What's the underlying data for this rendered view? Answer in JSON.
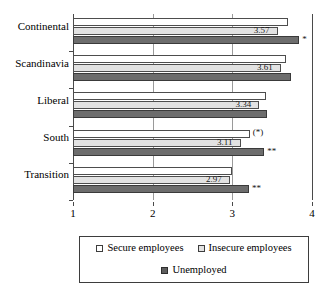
{
  "chart_data": {
    "type": "bar",
    "orientation": "horizontal",
    "title": "",
    "xlabel": "",
    "ylabel": "",
    "xlim": [
      1,
      4
    ],
    "xticks": [
      "1",
      "2",
      "3",
      "4"
    ],
    "grid": true,
    "legend_position": "bottom",
    "categories": [
      "Continental",
      "Scandinavia",
      "Liberal",
      "South",
      "Transition"
    ],
    "series": [
      {
        "name": "Secure employees",
        "color": "#ffffff",
        "values": [
          3.7,
          3.67,
          3.42,
          3.22,
          3.0
        ]
      },
      {
        "name": "Insecure employees",
        "color": "#e2e2e2",
        "values": [
          3.57,
          3.61,
          3.34,
          3.11,
          2.97
        ]
      },
      {
        "name": "Unemployed",
        "color": "#6d6d6d",
        "values": [
          3.84,
          3.74,
          3.43,
          3.4,
          3.21
        ]
      }
    ],
    "data_labels": {
      "Insecure employees": [
        "3.57",
        "3.61",
        "3.34",
        "3.11",
        "2.97"
      ]
    },
    "annotations": [
      {
        "category": "Continental",
        "series": "Unemployed",
        "text": "*"
      },
      {
        "category": "South",
        "series": "Secure employees",
        "text": "(*)"
      },
      {
        "category": "South",
        "series": "Unemployed",
        "text": "**"
      },
      {
        "category": "Transition",
        "series": "Unemployed",
        "text": "**"
      }
    ]
  },
  "legend": {
    "items": [
      {
        "label": "Secure employees"
      },
      {
        "label": "Insecure employees"
      },
      {
        "label": "Unemployed"
      }
    ]
  }
}
